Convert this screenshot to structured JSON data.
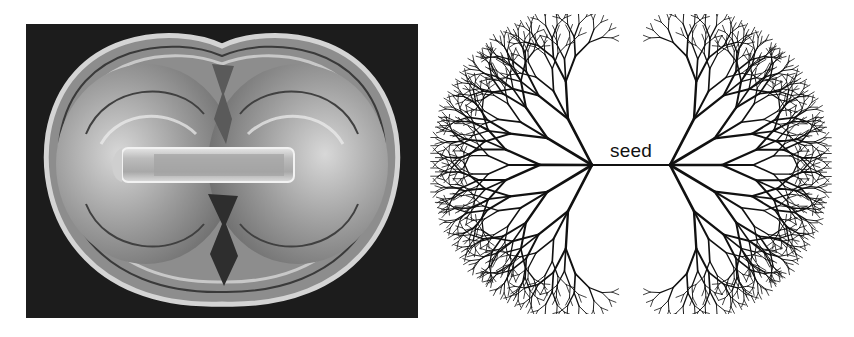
{
  "figure": {
    "left_panel": {
      "description": "grayscale micrograph of a peanut-shaped crystal growth around a central rod-shaped seed crystal",
      "background_color": "#1c1c1c"
    },
    "right_panel": {
      "description": "branching fractal tree structure growing outward from a horizontal seed line",
      "seed_label": "seed",
      "line_color": "#111111"
    }
  }
}
